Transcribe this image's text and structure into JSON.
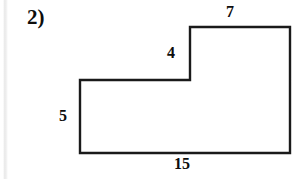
{
  "worksheet": {
    "problem_number": "2)"
  },
  "figure": {
    "name": "l-shaped-polygon",
    "stroke_color": "#1a1a1a",
    "fill_color": "#ffffff",
    "stroke_width": 2.4,
    "vertices": [
      [
        190,
        27
      ],
      [
        290,
        27
      ],
      [
        290,
        153
      ],
      [
        80,
        153
      ],
      [
        80,
        80
      ],
      [
        190,
        80
      ]
    ]
  },
  "chart_data": {
    "type": "diagram",
    "title": "",
    "shape": "L-shaped hexagon (composite rectangle)",
    "side_labels": [
      {
        "id": "top",
        "value": "7",
        "side": "top-right-horizontal",
        "position": "above"
      },
      {
        "id": "notch",
        "value": "4",
        "side": "inner-vertical",
        "position": "left"
      },
      {
        "id": "left",
        "value": "5",
        "side": "left-vertical",
        "position": "left"
      },
      {
        "id": "bottom",
        "value": "15",
        "side": "bottom-horizontal",
        "position": "below"
      }
    ]
  },
  "labels": {
    "top": "7",
    "notch": "4",
    "left": "5",
    "bottom": "15"
  }
}
